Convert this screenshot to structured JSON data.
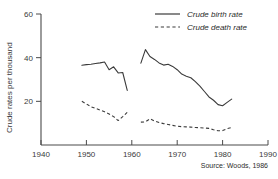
{
  "chart_data": {
    "type": "line",
    "title": "",
    "xlabel": "",
    "ylabel": "Crude rates per thousand",
    "xlim": [
      1940,
      1990
    ],
    "ylim": [
      0,
      60
    ],
    "grid": false,
    "legend_position": "top-right",
    "xticks": [
      1940,
      1950,
      1960,
      1970,
      1980,
      1990
    ],
    "xtick_labels": [
      "1940",
      "1950",
      "1960",
      "1970",
      "1980",
      "1990"
    ],
    "yticks": [
      20,
      40,
      60
    ],
    "ytick_labels": [
      "20",
      "40",
      "60"
    ],
    "annotations": [
      "Source: Woods, 1986"
    ],
    "series": [
      {
        "name": "Crude birth rate",
        "style": "solid",
        "color": "#3b3b3b",
        "segments": [
          {
            "x": [
              1949,
              1950,
              1951,
              1952,
              1953,
              1954,
              1955,
              1956,
              1957,
              1958,
              1959
            ],
            "values": [
              36.5,
              36.8,
              37.0,
              37.3,
              37.6,
              38.0,
              34.5,
              35.8,
              33.0,
              33.2,
              25.0
            ]
          },
          {
            "x": [
              1962,
              1963,
              1964,
              1965,
              1966,
              1967,
              1968,
              1969,
              1970,
              1971,
              1972,
              1973,
              1974,
              1975,
              1976,
              1977,
              1978,
              1979,
              1980,
              1981,
              1982
            ],
            "values": [
              37.5,
              43.7,
              40.5,
              39.2,
              37.6,
              36.6,
              37.0,
              36.0,
              34.5,
              32.5,
              31.5,
              30.8,
              29.0,
              27.0,
              24.5,
              22.0,
              20.5,
              18.5,
              18.0,
              19.5,
              21.0
            ]
          }
        ]
      },
      {
        "name": "Crude death rate",
        "style": "dashed",
        "color": "#3b3b3b",
        "segments": [
          {
            "x": [
              1949,
              1950,
              1951,
              1952,
              1953,
              1954,
              1955,
              1956,
              1957,
              1958,
              1959
            ],
            "values": [
              20.0,
              18.8,
              17.5,
              16.8,
              16.0,
              15.2,
              14.2,
              13.0,
              11.2,
              13.0,
              15.0
            ]
          },
          {
            "x": [
              1962,
              1963,
              1964,
              1965,
              1966,
              1967,
              1968,
              1969,
              1970,
              1971,
              1972,
              1973,
              1974,
              1975,
              1976,
              1977,
              1978,
              1979,
              1980,
              1981,
              1982
            ],
            "values": [
              10.5,
              10.6,
              12.0,
              11.0,
              10.3,
              9.8,
              9.4,
              9.0,
              8.6,
              8.4,
              8.3,
              8.2,
              8.0,
              7.9,
              7.8,
              7.6,
              7.0,
              6.5,
              6.6,
              7.5,
              8.0
            ]
          }
        ]
      }
    ]
  },
  "legend": {
    "entries": [
      {
        "label": "Crude birth rate",
        "style": "solid"
      },
      {
        "label": "Crude death rate",
        "style": "dashed"
      }
    ]
  },
  "source": {
    "text": "Source: Woods, 1986"
  }
}
